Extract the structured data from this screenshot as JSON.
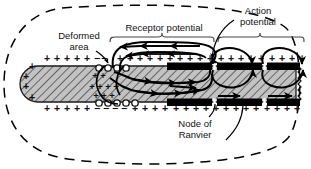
{
  "figure": {
    "type": "biological-diagram",
    "background_color": "#ffffff",
    "line_color": "#000000",
    "axon_fill_color": "#bdbdbd",
    "myelin_color": "#000000",
    "capsule_style": "dashed-oval"
  },
  "labels": {
    "deformed_area": "Deformed\narea",
    "deformed_area_line1": "Deformed",
    "deformed_area_line2": "area",
    "receptor_potential": "Receptor potential",
    "action_potential_line1": "Action",
    "action_potential_line2": "potential",
    "node_of_ranvier_line1": "Node of",
    "node_of_ranvier_line2": "Ranvier"
  },
  "charges": {
    "positive_symbol": "+",
    "negative_symbol": "−",
    "outer_top_positive_count": 26,
    "outer_bottom_positive_count": 27,
    "deformed_top_negative_count": 4,
    "deformed_bottom_negative_count": 5,
    "inner_positive_count": 9
  },
  "regions": [
    {
      "name": "deformed-area",
      "kind": "unmyelinated-terminal",
      "bracket": false
    },
    {
      "name": "receptor-potential",
      "kind": "local-current-loops",
      "bracket": true
    },
    {
      "name": "action-potential",
      "kind": "saltatory-conduction",
      "bracket": true
    }
  ],
  "nodes_of_ranvier": 3,
  "colors": {
    "stroke": "#000000",
    "axoplasm": "#bdbdbd",
    "myelin": "#000000",
    "page": "#ffffff"
  }
}
